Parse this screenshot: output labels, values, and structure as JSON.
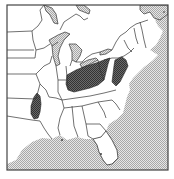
{
  "map": {
    "region": "Eastern United States",
    "style": "black-and-white line map",
    "legend": [],
    "colors": {
      "background": "#ffffff",
      "land": "#ffffff",
      "water_pattern_light": "#ffffff",
      "water_pattern_dark": "#b8b8b8",
      "range_fill": "#555555",
      "border": "#333333",
      "frame": "#444444"
    },
    "highlighted_areas": [
      {
        "name": "ohio-valley-range",
        "description": "shaded area covering Ohio, Indiana, West Virginia, and parts of Kentucky and Pennsylvania"
      },
      {
        "name": "mid-atlantic-range",
        "description": "shaded strip along Maryland, Delaware, and Virginia coast"
      },
      {
        "name": "arkansas-range",
        "description": "shaded oval area in western Arkansas"
      }
    ]
  }
}
